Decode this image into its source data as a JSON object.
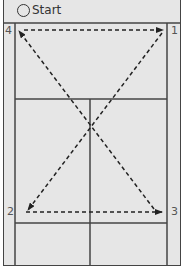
{
  "header": {
    "start_icon": "circle-outline-icon",
    "start_label": "Start"
  },
  "positions": [
    {
      "id": "1",
      "label": "1"
    },
    {
      "id": "2",
      "label": "2"
    },
    {
      "id": "3",
      "label": "3"
    },
    {
      "id": "4",
      "label": "4"
    }
  ],
  "paths": [
    {
      "from": "4",
      "to": "1",
      "style": "dashed-arrow"
    },
    {
      "from": "1",
      "to": "2",
      "style": "dashed-arrow"
    },
    {
      "from": "2",
      "to": "3",
      "style": "dashed-arrow"
    },
    {
      "from": "3",
      "to": "4",
      "style": "dashed-arrow"
    }
  ],
  "colors": {
    "court_fill": "#e6e6e6",
    "line": "#444444",
    "arrow": "#222222"
  }
}
